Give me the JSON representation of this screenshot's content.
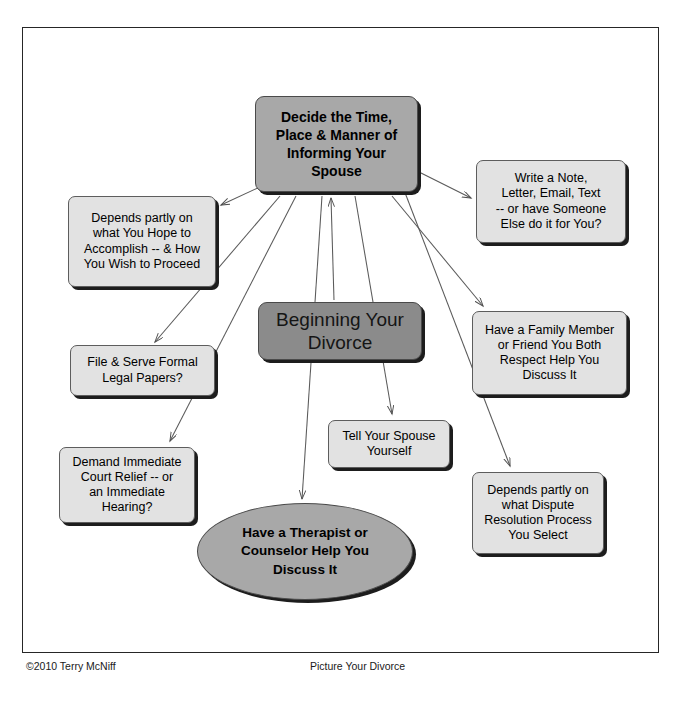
{
  "document": {
    "title": "Beginning Your Divorce",
    "footer_left": "©2010 Terry McNiff",
    "footer_center": "Picture Your Divorce"
  },
  "colors": {
    "primary_fill": "#a8a8a8",
    "topic_fill": "#8b8b8b",
    "node_fill": "#e2e2e2",
    "shadow": "#1d1d1d",
    "frame_border": "#262626",
    "connector": "#555555",
    "text": "#000000"
  },
  "diagram": {
    "type": "mind-map",
    "central_topic": {
      "id": "topic",
      "label": "Beginning Your Divorce",
      "shape": "rounded-rect",
      "style": "topic"
    },
    "primary_node": {
      "id": "decide",
      "label": "Decide the Time, Place & Manner of Informing Your Spouse",
      "lines": [
        "Decide the Time,",
        "Place & Manner of",
        "Informing Your",
        "Spouse"
      ],
      "shape": "rounded-rect",
      "style": "primary"
    },
    "nodes": [
      {
        "id": "write",
        "label": "Write a Note, Letter, Email, Text -- or have Someone Else do it for You?",
        "lines": [
          "Write a Note,",
          "Letter, Email, Text",
          "-- or have Someone",
          "Else do it for You?"
        ],
        "shape": "rounded-rect"
      },
      {
        "id": "depends-hope",
        "label": "Depends partly on what You Hope to Accomplish -- & How You Wish to Proceed",
        "lines": [
          "Depends partly on",
          "what You Hope to",
          "Accomplish -- & How",
          "You Wish to Proceed"
        ],
        "shape": "rounded-rect"
      },
      {
        "id": "family",
        "label": "Have a Family Member or Friend You Both Respect Help You Discuss It",
        "lines": [
          "Have a Family Member",
          "or Friend You Both",
          "Respect Help You",
          "Discuss It"
        ],
        "shape": "rounded-rect"
      },
      {
        "id": "file",
        "label": "File & Serve Formal Legal Papers?",
        "lines": [
          "File & Serve Formal",
          "Legal Papers?"
        ],
        "shape": "rounded-rect"
      },
      {
        "id": "demand",
        "label": "Demand Immediate Court Relief -- or an Immediate Hearing?",
        "lines": [
          "Demand Immediate",
          "Court Relief -- or",
          "an Immediate",
          "Hearing?"
        ],
        "shape": "rounded-rect"
      },
      {
        "id": "tell",
        "label": "Tell Your Spouse Yourself",
        "lines": [
          "Tell Your Spouse",
          "Yourself"
        ],
        "shape": "rounded-rect"
      },
      {
        "id": "dispute",
        "label": "Depends partly on what Dispute Resolution Process You Select",
        "lines": [
          "Depends partly on",
          "what Dispute",
          "Resolution Process",
          "You Select"
        ],
        "shape": "rounded-rect"
      },
      {
        "id": "therapist",
        "label": "Have a Therapist or Counselor Help You Discuss It",
        "lines": [
          "Have a Therapist or",
          "Counselor Help You",
          "Discuss It"
        ],
        "shape": "ellipse"
      }
    ],
    "connections": [
      {
        "from": "decide",
        "to": "depends-hope",
        "arrow": "to"
      },
      {
        "from": "decide",
        "to": "write",
        "arrow": "to"
      },
      {
        "from": "decide",
        "to": "file",
        "arrow": "to"
      },
      {
        "from": "decide",
        "to": "demand",
        "arrow": "to"
      },
      {
        "from": "decide",
        "to": "family",
        "arrow": "to"
      },
      {
        "from": "decide",
        "to": "dispute",
        "arrow": "to"
      },
      {
        "from": "decide",
        "to": "tell",
        "arrow": "to"
      },
      {
        "from": "decide",
        "to": "therapist",
        "arrow": "to"
      },
      {
        "from": "topic",
        "to": "decide",
        "arrow": "to"
      }
    ]
  }
}
